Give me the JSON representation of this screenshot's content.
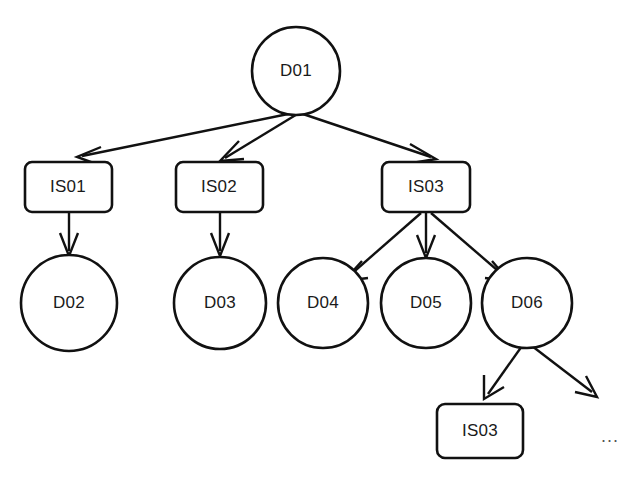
{
  "diagram": {
    "type": "tree-graph",
    "background_color": "#ffffff",
    "stroke_color": "#111111",
    "text_color": "#1a1a1a",
    "nodes": [
      {
        "id": "D01",
        "label": "D01",
        "shape": "circle",
        "cx": 296,
        "cy": 71,
        "r": 44
      },
      {
        "id": "IS01",
        "label": "IS01",
        "shape": "rounded-rect",
        "x": 25,
        "y": 162,
        "w": 87,
        "h": 50
      },
      {
        "id": "IS02",
        "label": "IS02",
        "shape": "rounded-rect",
        "x": 176,
        "y": 162,
        "w": 87,
        "h": 50
      },
      {
        "id": "IS03",
        "label": "IS03",
        "shape": "rounded-rect",
        "x": 382,
        "y": 162,
        "w": 88,
        "h": 50
      },
      {
        "id": "D02",
        "label": "D02",
        "shape": "circle",
        "cx": 69,
        "cy": 303,
        "r": 48
      },
      {
        "id": "D03",
        "label": "D03",
        "shape": "circle",
        "cx": 220,
        "cy": 303,
        "r": 46
      },
      {
        "id": "D04",
        "label": "D04",
        "shape": "circle",
        "cx": 323,
        "cy": 303,
        "r": 45
      },
      {
        "id": "D05",
        "label": "D05",
        "shape": "circle",
        "cx": 426,
        "cy": 303,
        "r": 45
      },
      {
        "id": "D06",
        "label": "D06",
        "shape": "circle",
        "cx": 527,
        "cy": 303,
        "r": 45
      },
      {
        "id": "IS03b",
        "label": "IS03",
        "shape": "rounded-rect",
        "x": 437,
        "y": 404,
        "w": 86,
        "h": 54
      }
    ],
    "edges": [
      {
        "from": "D01",
        "to": "IS01"
      },
      {
        "from": "D01",
        "to": "IS02"
      },
      {
        "from": "D01",
        "to": "IS03"
      },
      {
        "from": "IS01",
        "to": "D02"
      },
      {
        "from": "IS02",
        "to": "D03"
      },
      {
        "from": "IS03",
        "to": "D04"
      },
      {
        "from": "IS03",
        "to": "D05"
      },
      {
        "from": "IS03",
        "to": "D06"
      },
      {
        "from": "D06",
        "to": "IS03b"
      },
      {
        "from": "D06",
        "to": "continuation"
      }
    ],
    "ellipsis": {
      "label": "...",
      "x": 610,
      "y": 437
    }
  }
}
